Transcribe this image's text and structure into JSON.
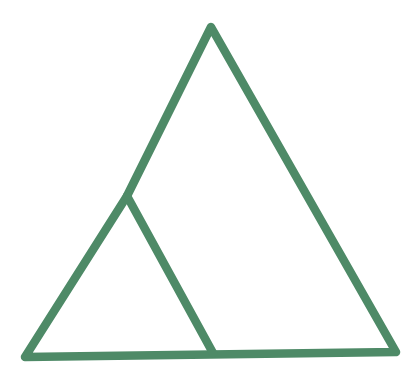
{
  "figure": {
    "type": "geometric-line-drawing",
    "background_color": "#ffffff",
    "stroke_color": "#4e8a67",
    "stroke_width": 8.5,
    "vertices": {
      "apex": [
        211,
        27
      ],
      "bottom_left": [
        25,
        357
      ],
      "bottom_right": [
        396,
        352
      ],
      "left_side_junction": [
        127,
        196
      ],
      "base_junction": [
        213,
        353
      ]
    },
    "outline_points": "211,27 396,352 25,357 127,196",
    "cevian_points": "127,196 213,353"
  }
}
